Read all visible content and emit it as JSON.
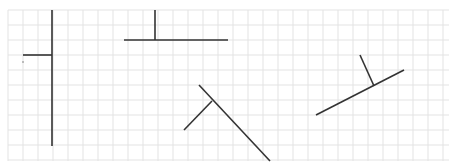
{
  "figure": {
    "width": 452,
    "height": 165,
    "grid": {
      "x0": 8,
      "y0": 10,
      "x1": 449,
      "y1": 161,
      "spacing": 15,
      "color": "#e3e3e3",
      "background": "#ffffff"
    },
    "stroke_color": "#333333",
    "stroke_width": 1.6,
    "shapes": [
      {
        "name": "inverted-t-left",
        "segments": [
          [
            52,
            10,
            52,
            146
          ],
          [
            23,
            55,
            52,
            55
          ]
        ]
      },
      {
        "name": "t-shape-top",
        "segments": [
          [
            155,
            10,
            155,
            40
          ],
          [
            124,
            40,
            228,
            40
          ]
        ]
      },
      {
        "name": "diagonal-shape-center",
        "segments": [
          [
            199,
            85,
            270,
            161
          ],
          [
            212,
            101,
            184,
            130
          ]
        ]
      },
      {
        "name": "tilted-shape-right",
        "segments": [
          [
            316,
            115,
            404,
            70
          ],
          [
            360,
            55,
            374,
            86
          ]
        ]
      }
    ],
    "marks": [
      {
        "x": 23,
        "y": 62,
        "r": 0.8
      }
    ]
  }
}
